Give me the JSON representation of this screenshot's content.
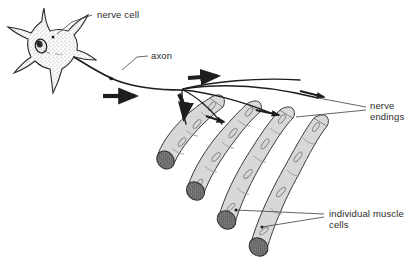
{
  "figure": {
    "background_color": "#ffffff",
    "ink_color": "#2b2b2b",
    "muscle_fill_color": "#d8d8d8",
    "muscle_band_color": "#c9c9c9",
    "cross_section_color": "#6e6e6e"
  },
  "labels": {
    "nerve_cell": "nerve cell",
    "axon": "axon",
    "nerve_endings_line1": "nerve",
    "nerve_endings_line2": "endings",
    "muscle_cells_line1": "individual muscle",
    "muscle_cells_line2": "cells"
  },
  "structures": {
    "neuron": {
      "name": "nerve cell",
      "soma_shape": "stellate",
      "dendrite_count": 7,
      "has_nucleus": true,
      "has_nucleolus": true,
      "cytoplasm_texture": "stippled"
    },
    "axon": {
      "name": "axon",
      "has_node_swelling": true,
      "terminal_branch_count": 4
    },
    "muscle_fibers": [
      {
        "index": 1,
        "name": "individual muscle cell",
        "segment_count": 4,
        "nuclei": 4,
        "cross_section": true
      },
      {
        "index": 2,
        "name": "individual muscle cell",
        "segment_count": 4,
        "nuclei": 4,
        "cross_section": true
      },
      {
        "index": 3,
        "name": "individual muscle cell",
        "segment_count": 4,
        "nuclei": 4,
        "cross_section": true
      },
      {
        "index": 4,
        "name": "individual muscle cell",
        "segment_count": 4,
        "nuclei": 4,
        "cross_section": true
      }
    ],
    "signal_arrows": {
      "count": 3,
      "meaning": "direction of nerve impulse"
    },
    "nerve_endings": {
      "name": "nerve endings",
      "contact_point_count": 4
    }
  }
}
